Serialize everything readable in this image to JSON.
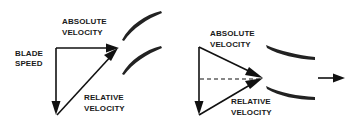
{
  "diagram": {
    "left": {
      "labels": {
        "absolute_velocity": [
          "ABSOLUTE",
          "VELOCITY"
        ],
        "blade_speed": [
          "BLADE",
          "SPEED"
        ],
        "relative_velocity": [
          "RELATIVE",
          "VELOCITY"
        ]
      }
    },
    "right": {
      "labels": {
        "absolute_velocity": [
          "ABSOLUTE",
          "VELOCITY"
        ],
        "relative_velocity": [
          "RELATIVE",
          "VELOCITY"
        ]
      }
    },
    "colors": {
      "stroke": "#111111",
      "background": "#ffffff"
    }
  }
}
